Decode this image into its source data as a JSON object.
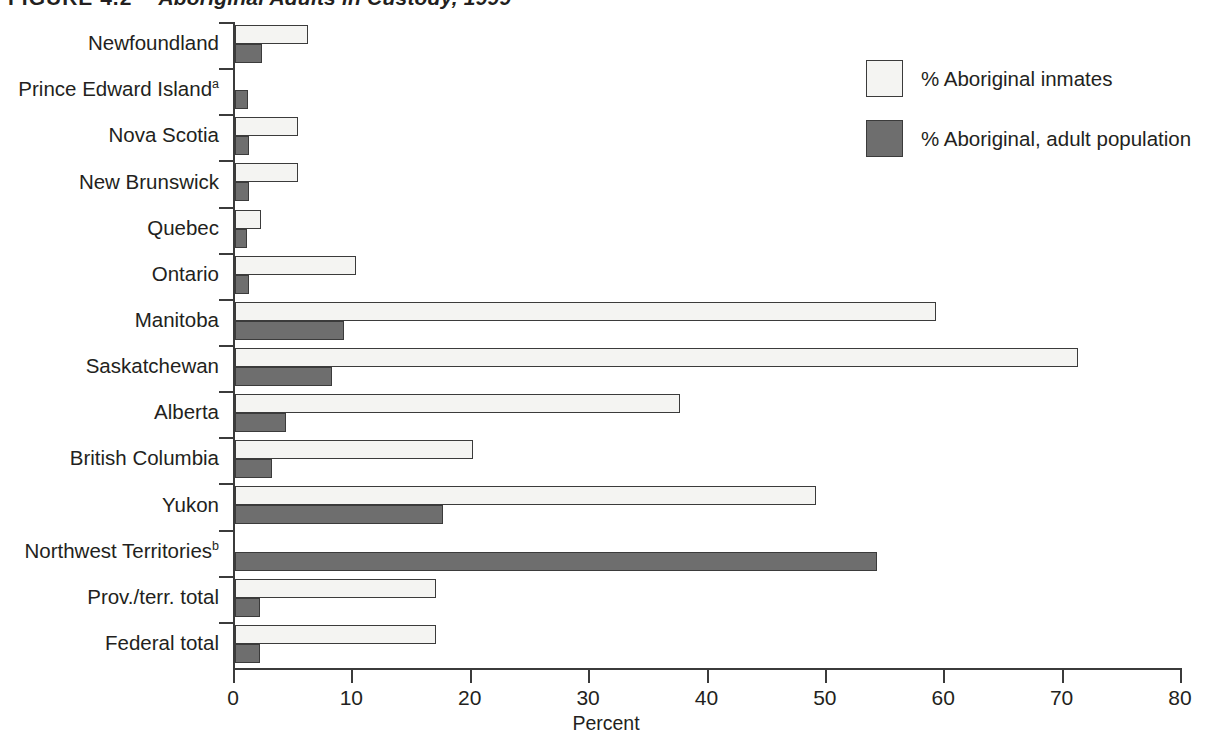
{
  "figure": {
    "number": "FIGURE 4.2",
    "title": "Aboriginal Adults in Custody, 1999"
  },
  "legend": {
    "items": [
      {
        "label": "% Aboriginal inmates",
        "swatch": "light-swatch",
        "color": "#f4f4f2"
      },
      {
        "label": "% Aboriginal, adult population",
        "swatch": "dark-swatch",
        "color": "#6e6e6e"
      }
    ]
  },
  "axis": {
    "x_title": "Percent",
    "x_ticks": [
      "0",
      "10",
      "20",
      "30",
      "40",
      "50",
      "60",
      "70",
      "80"
    ]
  },
  "chart_data": {
    "type": "bar",
    "orientation": "horizontal",
    "title": "Aboriginal Adults in Custody, 1999",
    "xlabel": "Percent",
    "ylabel": "",
    "xlim": [
      0,
      80
    ],
    "xticks": [
      0,
      10,
      20,
      30,
      40,
      50,
      60,
      70,
      80
    ],
    "grid": false,
    "legend_position": "top-right",
    "categories": [
      "Newfoundland",
      "Prince Edward Island",
      "Nova Scotia",
      "New Brunswick",
      "Quebec",
      "Ontario",
      "Manitoba",
      "Saskatchewan",
      "Alberta",
      "British Columbia",
      "Yukon",
      "Northwest Territories",
      "Prov./terr. total",
      "Federal total"
    ],
    "category_footnotes": {
      "Prince Edward Island": "a",
      "Northwest Territories": "b"
    },
    "series": [
      {
        "name": "% Aboriginal inmates",
        "color": "#f4f4f2",
        "values": [
          6.2,
          0.0,
          5.3,
          5.3,
          2.2,
          10.2,
          59.2,
          71.2,
          37.6,
          20.1,
          49.1,
          0.0,
          17.0,
          17.0
        ]
      },
      {
        "name": "% Aboriginal, adult population",
        "color": "#6e6e6e",
        "values": [
          2.3,
          1.1,
          1.2,
          1.2,
          1.0,
          1.2,
          9.2,
          8.2,
          4.3,
          3.1,
          17.6,
          54.2,
          2.1,
          2.1
        ]
      }
    ]
  }
}
